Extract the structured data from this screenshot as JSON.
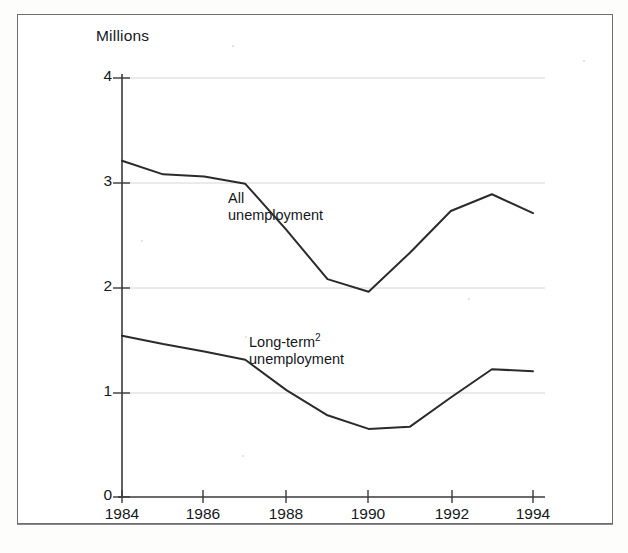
{
  "figure": {
    "unit_label": "Millions",
    "series_label_all_line1": "All",
    "series_label_all_line2": "unemployment",
    "series_label_longterm_line1": "Long-term",
    "series_label_longterm_footnote": "2",
    "series_label_longterm_line2": "unemployment",
    "line_color": "#2b2b2b",
    "axis_color": "#3a3a3a",
    "gridline_color": "#d6d6d6"
  },
  "chart_data": {
    "type": "line",
    "title": "",
    "subtitle": "",
    "xlabel": "",
    "ylabel": "Millions",
    "xlim": [
      1984,
      1994
    ],
    "ylim": [
      0,
      4
    ],
    "yticks": [
      0,
      1,
      2,
      3,
      4
    ],
    "ytick_labels": [
      "0",
      "1",
      "2",
      "3",
      "4"
    ],
    "xticks": [
      1984,
      1986,
      1988,
      1990,
      1992,
      1994
    ],
    "xtick_labels": [
      "1984",
      "1986",
      "1988",
      "1990",
      "1992",
      "1994"
    ],
    "grid": true,
    "grid_axis": "y",
    "legend": "inline-annotations",
    "legend_position": "inside-plot",
    "x": [
      1984,
      1985,
      1986,
      1987,
      1988,
      1989,
      1990,
      1991,
      1992,
      1993,
      1994
    ],
    "series": [
      {
        "name": "All unemployment",
        "values": [
          3.21,
          3.08,
          3.06,
          2.99,
          2.55,
          2.08,
          1.96,
          2.33,
          2.73,
          2.89,
          2.71
        ]
      },
      {
        "name": "Long-term unemployment",
        "values": [
          1.54,
          1.46,
          1.39,
          1.31,
          1.02,
          0.78,
          0.65,
          0.67,
          0.95,
          1.22,
          1.2
        ]
      }
    ],
    "annotations": [
      {
        "text": "All unemployment",
        "x": 1988.4,
        "y": 2.75
      },
      {
        "text": "Long-term2 unemployment",
        "x": 1988.6,
        "y": 1.45
      }
    ]
  }
}
